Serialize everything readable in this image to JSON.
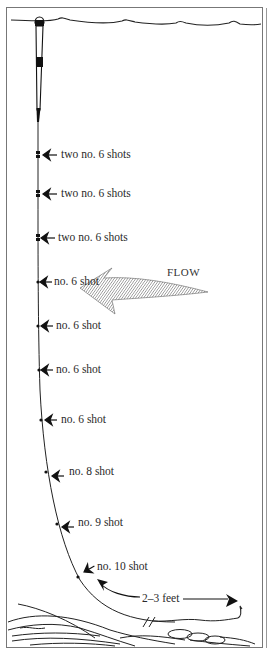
{
  "diagram": {
    "colors": {
      "ink": "#1a1a1a",
      "frame": "#777777",
      "hatch": "#555555"
    },
    "flow_label": "FLOW",
    "distance_label": "2–3 feet",
    "shots": [
      {
        "label": "two no. 6 shots",
        "x": 48,
        "y": 155
      },
      {
        "label": "two no. 6 shots",
        "x": 50,
        "y": 194
      },
      {
        "label": "two no. 6 shots",
        "x": 46,
        "y": 238
      },
      {
        "label": "no. 6 shot",
        "x": 53,
        "y": 282
      },
      {
        "label": "no. 6 shot",
        "x": 57,
        "y": 326
      },
      {
        "label": "no. 6 shot",
        "x": 56,
        "y": 370
      },
      {
        "label": "no. 6 shot",
        "x": 62,
        "y": 420
      },
      {
        "label": "no. 8 shot",
        "x": 69,
        "y": 472
      },
      {
        "label": "no. 9 shot",
        "x": 78,
        "y": 524
      },
      {
        "label": "no. 10 shot",
        "x": 98,
        "y": 565
      }
    ]
  }
}
